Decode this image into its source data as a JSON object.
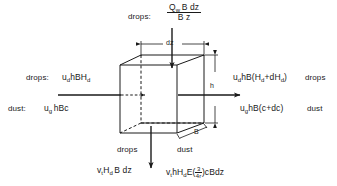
{
  "figure": {
    "type": "flux-balance-control-volume",
    "background_color": "#ffffff",
    "line_color": "#1a1a1a",
    "text_color": "#1a1a1a"
  },
  "top": {
    "source_label": "drops:",
    "flux": {
      "numerator": "Q",
      "numerator_sub": "w",
      "numerator_rest": "B dz",
      "denominator": "B z",
      "full": "Q_w B dz / B z"
    }
  },
  "left": {
    "drops_label": "drops:",
    "drops_flux_main": "u",
    "drops_flux_sub1": "d",
    "drops_flux_mid": "hBH",
    "drops_flux_sub2": "d",
    "drops_flux_full": "u_d hBH_d",
    "dust_label": "dust:",
    "dust_flux_main": "u",
    "dust_flux_sub1": "g",
    "dust_flux_rest": "hBc",
    "dust_flux_full": "u_g hBc"
  },
  "right": {
    "drops_flux_a": "u",
    "drops_flux_sub_a": "d",
    "drops_flux_b": "hB(H",
    "drops_flux_sub_b": "d",
    "drops_flux_c": "+dH",
    "drops_flux_sub_c": "d",
    "drops_flux_d": ")",
    "drops_flux_full": "u_d hB(H_d + dH_d)",
    "drops_label": "drops",
    "dust_flux_a": "u",
    "dust_flux_sub_a": "g",
    "dust_flux_b": "hB(c+dc)",
    "dust_flux_full": "u_g hB(c+dc)",
    "dust_label": "dust"
  },
  "bottom": {
    "drops_label": "drops",
    "dust_label": "dust",
    "drops_flux_a": "v",
    "drops_flux_sub_a": "t",
    "drops_flux_b": "H",
    "drops_flux_sub_b": "d",
    "drops_flux_c": "B dz",
    "drops_flux_full": "v_t H_d B dz",
    "dust_flux_a": "v",
    "dust_flux_sub_a": "t",
    "dust_flux_b": "hH",
    "dust_flux_sub_b": "d",
    "dust_flux_c": "E(",
    "dust_frac_num": "3",
    "dust_frac_den": "4r",
    "dust_flux_d": ")cBdz",
    "dust_flux_full": "v_t hH_d E(3/4r) cBdz"
  },
  "dimensions": {
    "width_label": "dz",
    "height_label": "h",
    "depth_label": "B"
  }
}
